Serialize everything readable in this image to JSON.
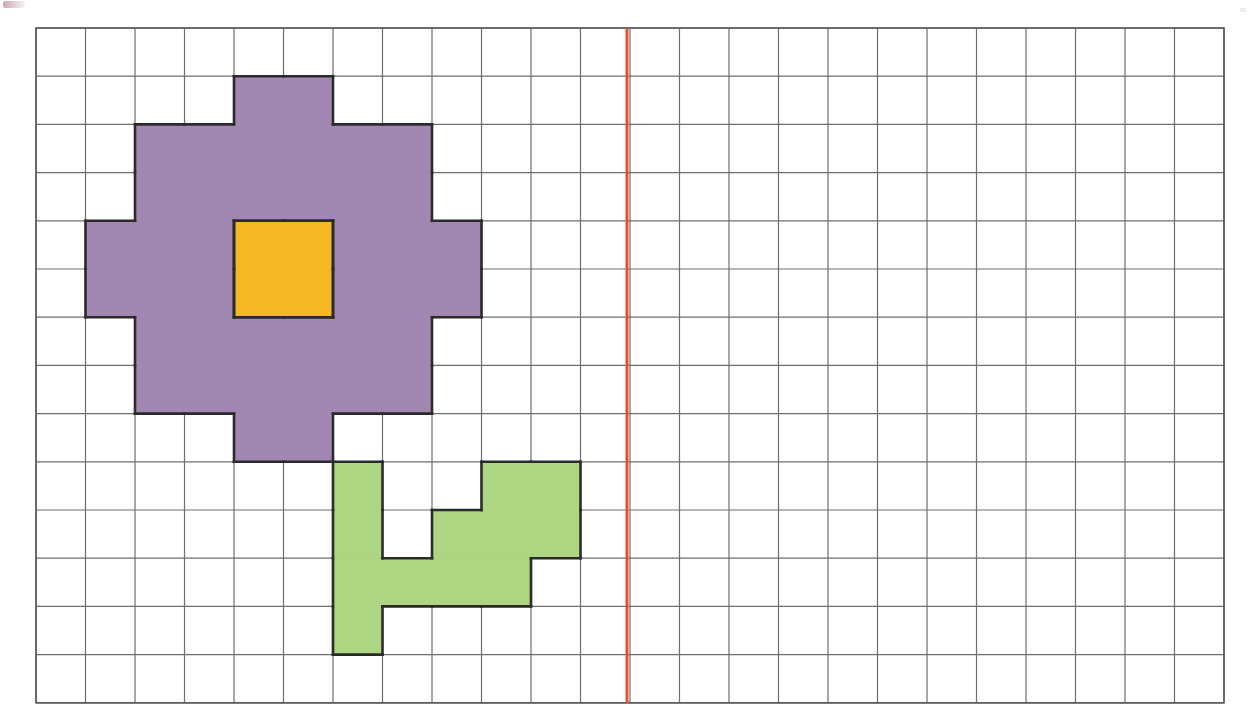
{
  "page": {
    "background_color": "#ffffff",
    "width": 1248,
    "height": 723
  },
  "grid": {
    "name": "square-grid",
    "origin_x": 36,
    "origin_y": 28,
    "cell_width": 49.5,
    "cell_height": 48.2,
    "columns": 24,
    "rows": 14,
    "line_color": "#6e6e6e",
    "line_width": 1.2,
    "border_color": "#5a5a5a",
    "border_width": 1.6
  },
  "symmetry_line": {
    "name": "line-of-symmetry",
    "orientation": "vertical",
    "column_index": 12,
    "x": 627,
    "y_start": 28,
    "y_end": 703,
    "color": "#e8502a",
    "width": 3
  },
  "figure": {
    "name": "flower",
    "outline_color": "#2b2b2b",
    "outline_width": 2.6,
    "parts": [
      {
        "name": "petals",
        "fill": "#a387b3",
        "cells": [
          [
            4,
            1
          ],
          [
            5,
            1
          ],
          [
            2,
            2
          ],
          [
            3,
            2
          ],
          [
            4,
            2
          ],
          [
            5,
            2
          ],
          [
            6,
            2
          ],
          [
            7,
            2
          ],
          [
            2,
            3
          ],
          [
            3,
            3
          ],
          [
            4,
            3
          ],
          [
            5,
            3
          ],
          [
            6,
            3
          ],
          [
            7,
            3
          ],
          [
            1,
            4
          ],
          [
            2,
            4
          ],
          [
            3,
            4
          ],
          [
            6,
            4
          ],
          [
            7,
            4
          ],
          [
            8,
            4
          ],
          [
            1,
            5
          ],
          [
            2,
            5
          ],
          [
            3,
            5
          ],
          [
            6,
            5
          ],
          [
            7,
            5
          ],
          [
            8,
            5
          ],
          [
            2,
            6
          ],
          [
            3,
            6
          ],
          [
            4,
            6
          ],
          [
            5,
            6
          ],
          [
            6,
            6
          ],
          [
            7,
            6
          ],
          [
            2,
            7
          ],
          [
            3,
            7
          ],
          [
            4,
            7
          ],
          [
            5,
            7
          ],
          [
            6,
            7
          ],
          [
            7,
            7
          ],
          [
            4,
            8
          ],
          [
            5,
            8
          ]
        ]
      },
      {
        "name": "flower-center",
        "fill": "#f5b724",
        "cells": [
          [
            4,
            4
          ],
          [
            5,
            4
          ],
          [
            4,
            5
          ],
          [
            5,
            5
          ]
        ]
      },
      {
        "name": "stem-and-leaves",
        "fill": "#aed581",
        "cells": [
          [
            6,
            9
          ],
          [
            9,
            9
          ],
          [
            10,
            9
          ],
          [
            6,
            10
          ],
          [
            8,
            10
          ],
          [
            9,
            10
          ],
          [
            10,
            10
          ],
          [
            6,
            11
          ],
          [
            7,
            11
          ],
          [
            8,
            11
          ],
          [
            9,
            11
          ],
          [
            6,
            12
          ]
        ]
      }
    ]
  },
  "colors": {
    "purple": "#a387b3",
    "yellow": "#f5b724",
    "green": "#aed581",
    "outline": "#2b2b2b",
    "grid_line": "#6e6e6e",
    "symmetry_red": "#e8502a",
    "background": "#ffffff"
  },
  "chart_data": {
    "type": "heatmap",
    "xlabel": "",
    "ylabel": "",
    "grid": true,
    "columns": 24,
    "rows": 14,
    "legend": [
      {
        "label": "petals",
        "color": "#a387b3"
      },
      {
        "label": "flower-center",
        "color": "#f5b724"
      },
      {
        "label": "stem-and-leaves",
        "color": "#aed581"
      },
      {
        "label": "line-of-symmetry",
        "color": "#e8502a"
      }
    ],
    "annotations": [
      {
        "type": "vline",
        "column": 12,
        "color": "#e8502a",
        "label": "line-of-symmetry"
      }
    ]
  }
}
